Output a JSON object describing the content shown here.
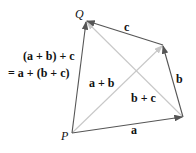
{
  "diagram": {
    "points": {
      "P": {
        "label": "P",
        "x": 72,
        "y": 133
      },
      "Q": {
        "label": "Q",
        "x": 86,
        "y": 21
      }
    },
    "vectors": [
      {
        "label": "a",
        "from": [
          72,
          133
        ],
        "to": [
          183,
          117
        ]
      },
      {
        "label": "b",
        "from": [
          183,
          117
        ],
        "to": [
          163,
          45
        ]
      },
      {
        "label": "c",
        "from": [
          163,
          45
        ],
        "to": [
          86,
          21
        ]
      }
    ],
    "diagonals": [
      {
        "label": "a + b",
        "from": [
          72,
          133
        ],
        "to": [
          163,
          45
        ]
      },
      {
        "label": "b + c",
        "from": [
          183,
          117
        ],
        "to": [
          86,
          21
        ]
      }
    ],
    "resultant": {
      "from": [
        72,
        133
      ],
      "to": [
        86,
        21
      ]
    },
    "equation": {
      "line1": "(a + b) + c",
      "line2": "= a + (b + c)"
    },
    "colors": {
      "edge": "#555555",
      "diagonal": "#c8c8c8",
      "text": "#111111"
    }
  }
}
